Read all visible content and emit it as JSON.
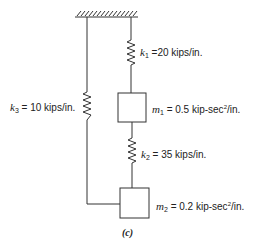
{
  "figure": {
    "caption": "(c)",
    "ground": "fixed-support",
    "springs": [
      {
        "symbol": "k",
        "subscript": "1",
        "equals": "=20 kips/in.",
        "value": 20,
        "unit": "kips/in."
      },
      {
        "symbol": "k",
        "subscript": "2",
        "equals": "= 35 kips/in.",
        "value": 35,
        "unit": "kips/in."
      },
      {
        "symbol": "k",
        "subscript": "3",
        "equals": "= 10 kips/in.",
        "value": 10,
        "unit": "kips/in."
      }
    ],
    "masses": [
      {
        "symbol": "m",
        "subscript": "1",
        "equals": "= 0.5 kip-sec",
        "power": "2",
        "tail": "/in.",
        "value": 0.5,
        "unit": "kip-sec²/in."
      },
      {
        "symbol": "m",
        "subscript": "2",
        "equals": "= 0.2 kip-sec",
        "power": "2",
        "tail": "/in.",
        "value": 0.2,
        "unit": "kip-sec²/in."
      }
    ]
  },
  "colors": {
    "line": "#333333",
    "text": "#222222",
    "background": "#ffffff"
  }
}
